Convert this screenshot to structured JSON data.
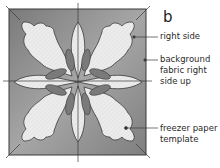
{
  "panel_letter": "b",
  "labels": {
    "right_side": "right side",
    "background_line1": "background",
    "background_line2": "fabric right",
    "background_line3": "side up",
    "freezer_line1": "freezer paper",
    "freezer_line2": "template"
  },
  "colors": {
    "background_fabric": "#8a8a8a",
    "applique_shape": "#e9e9e9",
    "template_tab": "#7d7d7d",
    "outline": "#3a3a3a",
    "guide_lines": "#3a3a3a"
  }
}
